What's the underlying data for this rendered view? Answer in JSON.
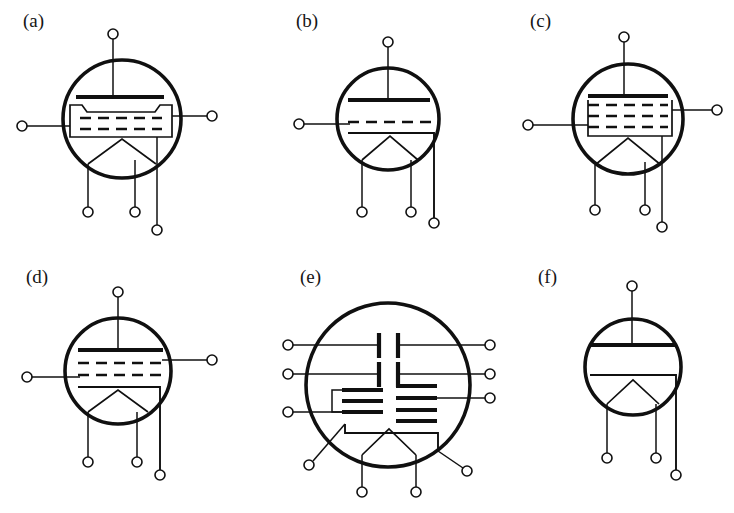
{
  "figure": {
    "kind": "vacuum-tube-schematic-symbols",
    "background": "#ffffff",
    "ink": "#101010",
    "panels": [
      {
        "id": "a",
        "label": "(a)",
        "tube_type": "beam-power-tetrode",
        "envelope": {
          "cx": 122,
          "cy": 119,
          "r": 59
        },
        "label_pos": {
          "x": 23,
          "y": 27
        },
        "electrodes": {
          "anode_plate": true,
          "dashed_grids": 2,
          "beam_forming_plates": true,
          "cathode_chevron": true
        },
        "pins": {
          "top": 1,
          "left": 1,
          "right": 1,
          "bottom": 3
        }
      },
      {
        "id": "b",
        "label": "(b)",
        "tube_type": "triode",
        "envelope": {
          "cx": 388,
          "cy": 119,
          "r": 51
        },
        "label_pos": {
          "x": 296,
          "y": 27
        },
        "electrodes": {
          "anode_plate": true,
          "dashed_grids": 1,
          "beam_forming_plates": false,
          "cathode_chevron": true
        },
        "pins": {
          "top": 1,
          "left": 1,
          "right": 0,
          "bottom": 3
        }
      },
      {
        "id": "c",
        "label": "(c)",
        "tube_type": "pentode",
        "envelope": {
          "cx": 628,
          "cy": 119,
          "r": 55
        },
        "label_pos": {
          "x": 530,
          "y": 27
        },
        "electrodes": {
          "anode_plate": true,
          "dashed_grids": 3,
          "beam_forming_plates": false,
          "cathode_chevron": true
        },
        "pins": {
          "top": 1,
          "left": 1,
          "right": 1,
          "bottom": 3
        }
      },
      {
        "id": "d",
        "label": "(d)",
        "tube_type": "tetrode",
        "envelope": {
          "cx": 118,
          "cy": 371,
          "r": 53
        },
        "label_pos": {
          "x": 26,
          "y": 283
        },
        "electrodes": {
          "anode_plate": true,
          "dashed_grids": 2,
          "beam_forming_plates": false,
          "cathode_chevron": true
        },
        "pins": {
          "top": 1,
          "left": 1,
          "right": 1,
          "bottom": 3
        }
      },
      {
        "id": "e",
        "label": "(e)",
        "tube_type": "dual-multigrid-tube",
        "envelope": {
          "cx": 388,
          "cy": 385,
          "r": 82
        },
        "label_pos": {
          "x": 300,
          "y": 283
        },
        "electrodes": {
          "anode_plate": false,
          "vertical_anode_plates": 4,
          "grid_bars_left": 3,
          "grid_bars_right": 4,
          "cathode_chevron": true
        },
        "pins": {
          "top": 0,
          "left": 3,
          "right": 3,
          "bottom": 4
        }
      },
      {
        "id": "f",
        "label": "(f)",
        "tube_type": "diode",
        "envelope": {
          "cx": 633,
          "cy": 367,
          "r": 48
        },
        "label_pos": {
          "x": 538,
          "y": 283
        },
        "electrodes": {
          "anode_plate": true,
          "dashed_grids": 0,
          "beam_forming_plates": false,
          "cathode_chevron": true
        },
        "pins": {
          "top": 1,
          "left": 0,
          "right": 0,
          "bottom": 3
        }
      }
    ],
    "caption": ""
  }
}
